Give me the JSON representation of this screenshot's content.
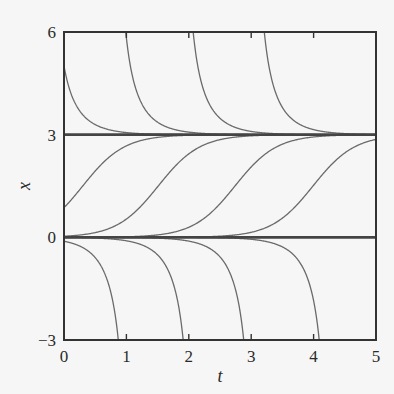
{
  "chart_data": {
    "type": "line",
    "title": "",
    "xlabel": "t",
    "ylabel": "x",
    "xlim": [
      0,
      5
    ],
    "ylim": [
      -3,
      6
    ],
    "xticks": [
      0,
      1,
      2,
      3,
      4,
      5
    ],
    "yticks": [
      -3,
      0,
      3,
      6
    ],
    "xtick_labels": [
      "0",
      "1",
      "2",
      "3",
      "4",
      "5"
    ],
    "ytick_labels": [
      "−3",
      "0",
      "3",
      "6"
    ],
    "grid": false,
    "legend": null,
    "model": "dx/dt = x(3 - x)",
    "equilibria": [
      {
        "x": 3,
        "stability": "stable"
      },
      {
        "x": 0,
        "stability": "unstable"
      }
    ],
    "series": [
      {
        "name": "equilibrium x=3",
        "kind": "constant",
        "value": 3
      },
      {
        "name": "equilibrium x=0",
        "kind": "constant",
        "value": 0
      },
      {
        "name": "decay from above 1",
        "kind": "above",
        "t_at_x6": -0.074,
        "x_at_t0": 5.0
      },
      {
        "name": "decay from above 2",
        "kind": "above",
        "t_at_x6": 0.99
      },
      {
        "name": "decay from above 3",
        "kind": "above",
        "t_at_x6": 2.07
      },
      {
        "name": "decay from above 4",
        "kind": "above",
        "t_at_x6": 3.21
      },
      {
        "name": "rising 1",
        "kind": "rising",
        "t_at_x1_5": 0.3,
        "x_at_t0": 0.79
      },
      {
        "name": "rising 2",
        "kind": "rising",
        "t_at_x1_5": 1.51
      },
      {
        "name": "rising 3",
        "kind": "rising",
        "t_at_x1_5": 2.74
      },
      {
        "name": "rising 4",
        "kind": "rising",
        "t_at_x1_5": 3.99
      },
      {
        "name": "diverging below 1",
        "kind": "below",
        "t_at_xm3": 0.87
      },
      {
        "name": "diverging below 2",
        "kind": "below",
        "t_at_xm3": 1.91
      },
      {
        "name": "diverging below 3",
        "kind": "below",
        "t_at_xm3": 2.88
      },
      {
        "name": "diverging below 4",
        "kind": "below",
        "t_at_xm3": 4.09
      }
    ]
  },
  "style": {
    "background": "#f6f6f6",
    "frame_color": "#333333",
    "curve_color": "#6a6a6a",
    "equilibrium_color": "#444444"
  },
  "layout": {
    "plot_left": 64,
    "plot_top": 32,
    "plot_right": 376,
    "plot_bottom": 340
  }
}
